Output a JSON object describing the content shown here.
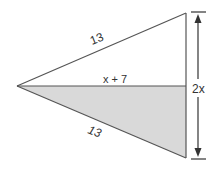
{
  "diagram": {
    "type": "geometry-figure",
    "labels": {
      "top_side": "13",
      "bottom_side": "13",
      "altitude": "x + 7",
      "base": "2x"
    },
    "colors": {
      "stroke": "#555555",
      "shade": "#d9d9d9",
      "background": "#ffffff",
      "text": "#333333"
    },
    "points": {
      "apex": [
        17,
        86
      ],
      "top": [
        186,
        13
      ],
      "mid": [
        186,
        86
      ],
      "bottom": [
        186,
        158
      ]
    },
    "dimension_arrow": {
      "x": 198,
      "y_top": 12,
      "y_bottom": 159,
      "label": "2x"
    }
  }
}
